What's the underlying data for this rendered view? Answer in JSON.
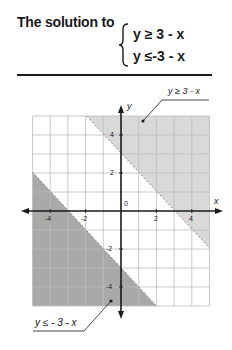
{
  "header": {
    "title": "The solution to",
    "system": [
      {
        "lhs": "y",
        "op": "≥",
        "rhs": "3 - x",
        "text": "y ≥  3 - x"
      },
      {
        "lhs": "y",
        "op": "≤",
        "rhs": "-3 - x",
        "text": "y ≤-3 - x"
      }
    ]
  },
  "graph": {
    "x_axis_label": "x",
    "y_axis_label": "y",
    "origin_label": "0",
    "x_ticks": [
      "-4",
      "-2",
      "2",
      "4"
    ],
    "y_ticks": [
      "4",
      "2",
      "-2",
      "-4"
    ],
    "region_upper_label": "y ≥ 3 - x",
    "region_lower_label": "y ≤ - 3 - x",
    "colors": {
      "upper_region": "#d9d9d9",
      "lower_region": "#a9a9a9",
      "grid": "#bdbdbd",
      "axis": "#1a1a1a"
    }
  }
}
